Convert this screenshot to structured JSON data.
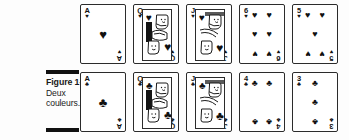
{
  "figure": {
    "caption_lines": [
      "Figure 1-5 :",
      "Deux",
      "couleurs."
    ],
    "caption_label": "Figure 1-5 :",
    "caption_body_line1": "Deux",
    "caption_body_line2": "couleurs.",
    "rule_color": "#111111",
    "ink_color": "#111111",
    "background": "#fdfdfd"
  },
  "rows": [
    {
      "name": "hearts-row",
      "suit": "hearts",
      "suit_symbol": "♥",
      "cards": [
        {
          "rank": "A",
          "suit_symbol": "♥",
          "suit": "hearts",
          "type": "ace",
          "pip_count": 1
        },
        {
          "rank": "Q",
          "suit_symbol": "♥",
          "suit": "hearts",
          "type": "court",
          "pip_count": 0
        },
        {
          "rank": "J",
          "suit_symbol": "♥",
          "suit": "hearts",
          "type": "court",
          "pip_count": 0
        },
        {
          "rank": "6",
          "suit_symbol": "♥",
          "suit": "hearts",
          "type": "number",
          "pip_count": 6
        },
        {
          "rank": "5",
          "suit_symbol": "♥",
          "suit": "hearts",
          "type": "number",
          "pip_count": 5
        }
      ]
    },
    {
      "name": "clubs-row",
      "suit": "clubs",
      "suit_symbol": "♣",
      "cards": [
        {
          "rank": "A",
          "suit_symbol": "♣",
          "suit": "clubs",
          "type": "ace",
          "pip_count": 1
        },
        {
          "rank": "Q",
          "suit_symbol": "♣",
          "suit": "clubs",
          "type": "court",
          "pip_count": 0
        },
        {
          "rank": "J",
          "suit_symbol": "♣",
          "suit": "clubs",
          "type": "court",
          "pip_count": 0
        },
        {
          "rank": "4",
          "suit_symbol": "♣",
          "suit": "clubs",
          "type": "number",
          "pip_count": 4
        },
        {
          "rank": "3",
          "suit_symbol": "♣",
          "suit": "clubs",
          "type": "number",
          "pip_count": 3
        }
      ]
    }
  ]
}
